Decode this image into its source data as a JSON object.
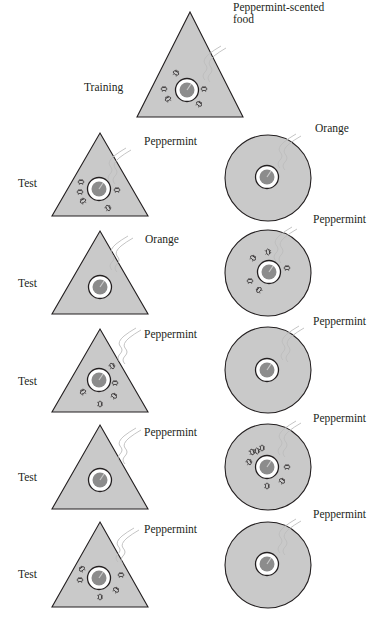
{
  "training": {
    "label": "Training",
    "shape": "triangle",
    "scent": "Peppermint-scented food",
    "scent_line1": "Peppermint-scented",
    "scent_line2": "food",
    "bees_present": true
  },
  "tests": [
    {
      "label": "Test",
      "triangle": {
        "scent": "Peppermint",
        "bees_present": true
      },
      "circle": {
        "scent": "Orange",
        "bees_present": false
      }
    },
    {
      "label": "Test",
      "triangle": {
        "scent": "Orange",
        "bees_present": false
      },
      "circle": {
        "scent": "Peppermint",
        "bees_present": true
      }
    },
    {
      "label": "Test",
      "triangle": {
        "scent": "Peppermint",
        "bees_present": true
      },
      "circle": {
        "scent": "Peppermint",
        "bees_present": false
      }
    },
    {
      "label": "Test",
      "triangle": {
        "scent": "Peppermint",
        "bees_present": false
      },
      "circle": {
        "scent": "Peppermint",
        "bees_present": true
      }
    },
    {
      "label": "Test",
      "triangle": {
        "scent": "Peppermint",
        "bees_present": true
      },
      "circle": {
        "scent": "Peppermint",
        "bees_present": false
      }
    }
  ],
  "colors": {
    "shape_fill": "#c9c9c9",
    "shape_stroke": "#231f20",
    "food_fill": "#8c8c8c",
    "dish_fill": "#ffffff",
    "scent_line": "#bdbdbd"
  }
}
